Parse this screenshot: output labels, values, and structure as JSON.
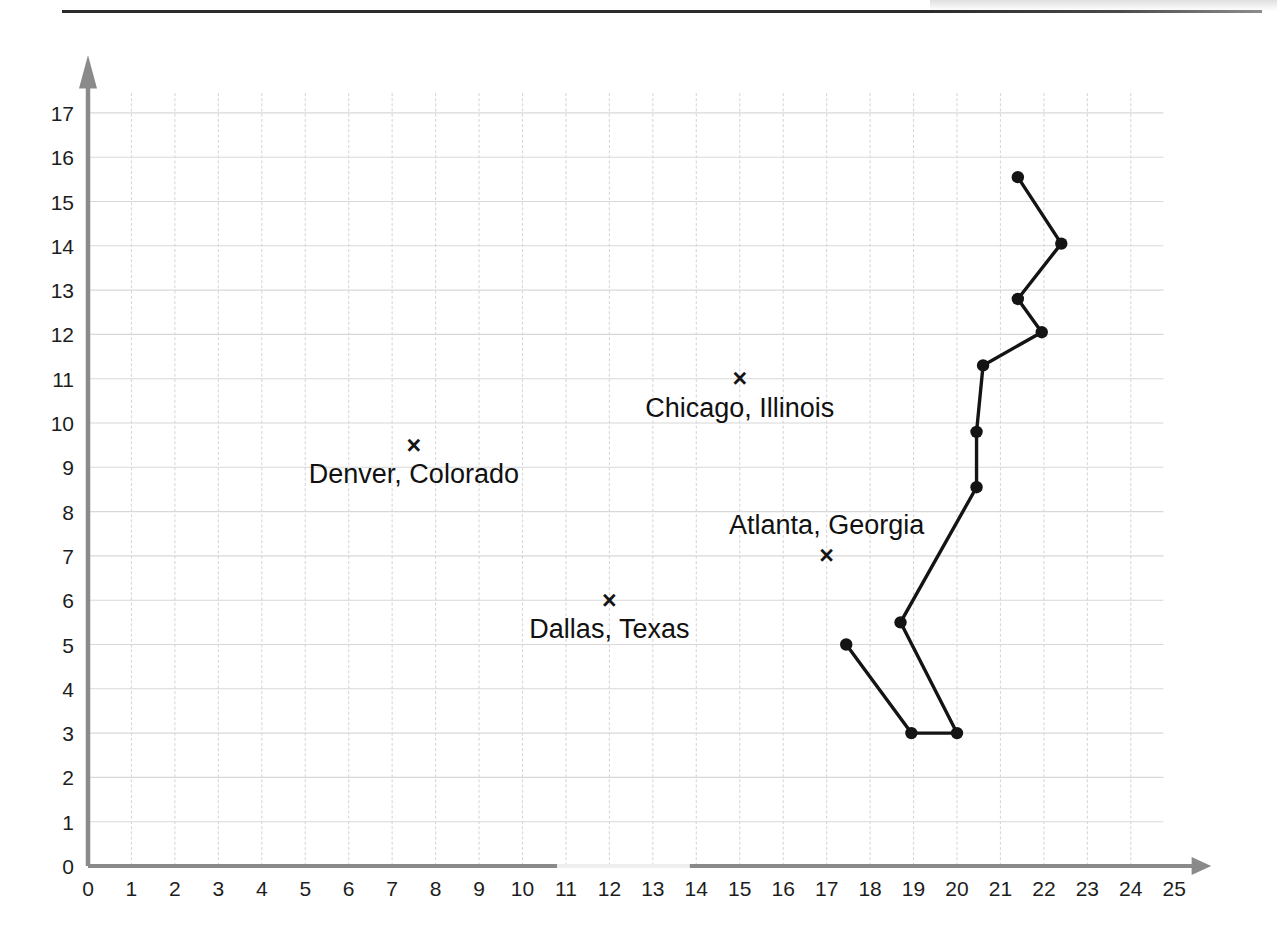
{
  "chart_data": {
    "type": "scatter",
    "title": "",
    "xlabel": "",
    "ylabel": "",
    "xlim": [
      0,
      25
    ],
    "ylim": [
      0,
      17
    ],
    "grid": true,
    "legend": "none",
    "x_ticks": [
      "0",
      "1",
      "2",
      "3",
      "4",
      "5",
      "6",
      "7",
      "8",
      "9",
      "10",
      "11",
      "12",
      "13",
      "14",
      "15",
      "16",
      "17",
      "18",
      "19",
      "20",
      "21",
      "22",
      "23",
      "24",
      "25"
    ],
    "y_ticks": [
      "0",
      "1",
      "2",
      "3",
      "4",
      "5",
      "6",
      "7",
      "8",
      "9",
      "10",
      "11",
      "12",
      "13",
      "14",
      "15",
      "16",
      "17"
    ],
    "annotated_points": [
      {
        "label": "Denver, Colorado",
        "x": 7.5,
        "y": 9.5,
        "marker": "x",
        "label_pos": "below"
      },
      {
        "label": "Chicago, Illinois",
        "x": 15.0,
        "y": 11.0,
        "marker": "x",
        "label_pos": "below"
      },
      {
        "label": "Dallas, Texas",
        "x": 12.0,
        "y": 6.0,
        "marker": "x",
        "label_pos": "below"
      },
      {
        "label": "Atlanta, Georgia",
        "x": 17.0,
        "y": 7.0,
        "marker": "x",
        "label_pos": "above"
      }
    ],
    "series": [
      {
        "name": "path",
        "type": "line",
        "marker": "filled-circle",
        "points": [
          {
            "x": 17.45,
            "y": 5.0
          },
          {
            "x": 18.95,
            "y": 3.0
          },
          {
            "x": 20.0,
            "y": 3.0
          },
          {
            "x": 18.7,
            "y": 5.5
          },
          {
            "x": 20.45,
            "y": 8.55
          },
          {
            "x": 20.45,
            "y": 9.8
          },
          {
            "x": 20.6,
            "y": 11.3
          },
          {
            "x": 21.95,
            "y": 12.05
          },
          {
            "x": 21.4,
            "y": 12.8
          },
          {
            "x": 22.4,
            "y": 14.05
          },
          {
            "x": 21.4,
            "y": 15.55
          }
        ]
      }
    ],
    "colors": {
      "grid": "#d8d8d8",
      "axis": "#8a8a8a",
      "series": "#141414",
      "text": "#1a1a1a"
    }
  }
}
